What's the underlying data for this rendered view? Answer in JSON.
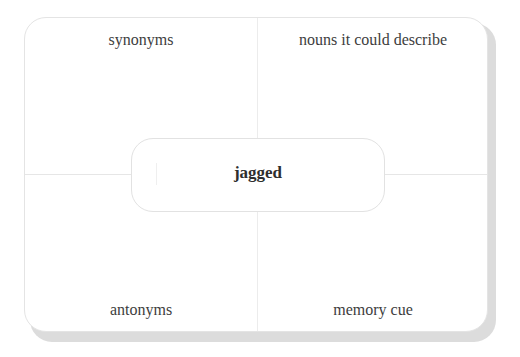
{
  "diagram": {
    "type": "frayer-model",
    "center_word": "jagged",
    "quadrants": {
      "top_left": "synonyms",
      "top_right": "nouns it could describe",
      "bottom_left": "antonyms",
      "bottom_right": "memory cue"
    }
  },
  "colors": {
    "card_background": "#ffffff",
    "card_border": "#e4e4e4",
    "shadow": "#dcdcdc",
    "divider": "#e6e6e6",
    "label_text": "#3d3d3d",
    "center_text": "#2e2e2e"
  }
}
